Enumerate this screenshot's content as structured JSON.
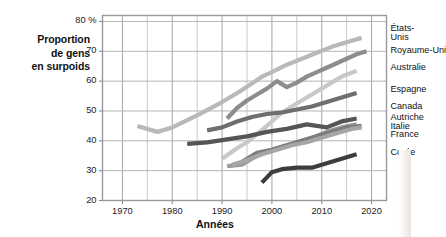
{
  "figure": {
    "background": "#ffffff",
    "plot_background": "#ffffff",
    "grid_color": "#bfbfbf",
    "frame_color": "#9a9a9a"
  },
  "axis_titles": {
    "y_line1": "Proportion",
    "y_line2": "de gens",
    "y_line3": "en surpoids",
    "x": "Années"
  },
  "ticks": {
    "y": [
      "80 %",
      "70",
      "60",
      "50",
      "40",
      "30",
      "20"
    ],
    "x": [
      "1970",
      "1980",
      "1990",
      "2000",
      "2010",
      "2020"
    ]
  },
  "chart_data": {
    "type": "line",
    "title": "",
    "subtitle": "",
    "xlabel": "Années",
    "ylabel": "Proportion de gens en surpoids",
    "xlim": [
      1966,
      2023
    ],
    "ylim": [
      20,
      82
    ],
    "yticks": [
      20,
      30,
      40,
      50,
      60,
      70,
      80
    ],
    "xticks": [
      1970,
      1980,
      1990,
      2000,
      2010,
      2020
    ],
    "grid": true,
    "grid_minor_x_step": 5,
    "legend_position": "right-inline",
    "y_unit": "%",
    "series": [
      {
        "name": "États-Unis",
        "color": "#b9b9b9",
        "label_lines": [
          "États-",
          "Unis"
        ],
        "x": [
          1973,
          1977,
          1980,
          1985,
          1990,
          1994,
          1998,
          2000,
          2003,
          2006,
          2009,
          2012,
          2015,
          2018
        ],
        "values": [
          45.0,
          43.0,
          44.5,
          48.5,
          53.0,
          57.0,
          61.5,
          63.0,
          65.5,
          67.5,
          69.5,
          71.5,
          73.0,
          74.5
        ]
      },
      {
        "name": "Royaume-Uni",
        "color": "#8d8d8d",
        "label_lines": [
          "Royaume-Uni"
        ],
        "x": [
          1991,
          1993,
          1995,
          1997,
          1999,
          2001,
          2003,
          2005,
          2007,
          2009,
          2011,
          2013,
          2015,
          2017,
          2019
        ],
        "values": [
          47.5,
          51.0,
          53.5,
          55.5,
          57.5,
          60.0,
          58.0,
          59.5,
          61.5,
          63.0,
          64.5,
          66.0,
          67.5,
          69.0,
          70.0
        ]
      },
      {
        "name": "Australie",
        "color": "#c8c8c8",
        "label_lines": [
          "Australie"
        ],
        "x": [
          1990,
          1993,
          1995,
          1999,
          2002,
          2005,
          2008,
          2011,
          2014,
          2017
        ],
        "values": [
          34.0,
          37.5,
          39.5,
          45.0,
          49.5,
          52.5,
          55.5,
          58.5,
          61.5,
          63.5
        ]
      },
      {
        "name": "Espagne",
        "color": "#6e6e6e",
        "label_lines": [
          "Espagne"
        ],
        "x": [
          1987,
          1990,
          1993,
          1996,
          1999,
          2002,
          2005,
          2008,
          2011,
          2014,
          2017
        ],
        "values": [
          43.5,
          44.5,
          46.5,
          48.0,
          49.0,
          49.5,
          50.5,
          51.5,
          53.0,
          54.5,
          56.0
        ]
      },
      {
        "name": "Canada",
        "color": "#9c9c9c",
        "label_lines": [
          "Canada"
        ],
        "x": [
          1991,
          1994,
          1996,
          1998,
          2000,
          2003,
          2005,
          2008,
          2011,
          2014,
          2017
        ],
        "values": [
          31.5,
          32.0,
          34.0,
          36.0,
          37.0,
          38.5,
          39.5,
          41.0,
          43.0,
          44.5,
          45.5
        ]
      },
      {
        "name": "Autriche",
        "color": "#555555",
        "label_lines": [
          "Autriche"
        ],
        "x": [
          1983,
          1987,
          1991,
          1995,
          1999,
          2003,
          2007,
          2011,
          2014,
          2017
        ],
        "values": [
          39.0,
          39.5,
          40.5,
          41.5,
          43.0,
          44.0,
          45.5,
          44.5,
          46.5,
          47.5
        ]
      },
      {
        "name": "Italie",
        "color": "#7d7d7d",
        "label_lines": [
          "Italie"
        ],
        "x": [
          1994,
          1997,
          2000,
          2003,
          2006,
          2009,
          2012,
          2015,
          2018
        ],
        "values": [
          33.0,
          36.0,
          37.0,
          38.5,
          40.0,
          41.5,
          43.0,
          44.5,
          45.0
        ]
      },
      {
        "name": "France",
        "color": "#a6a6a6",
        "label_lines": [
          "France"
        ],
        "x": [
          1992,
          1995,
          1998,
          2001,
          2004,
          2007,
          2010,
          2013,
          2016,
          2018
        ],
        "values": [
          32.0,
          33.5,
          35.5,
          37.0,
          38.5,
          39.5,
          41.0,
          42.5,
          44.0,
          44.5
        ]
      },
      {
        "name": "Corée",
        "color": "#3d3d3d",
        "label_lines": [
          "Corée"
        ],
        "x": [
          1998,
          2000,
          2002,
          2005,
          2008,
          2011,
          2014,
          2017
        ],
        "values": [
          26.0,
          29.5,
          30.5,
          31.0,
          31.0,
          32.5,
          34.0,
          35.5
        ]
      }
    ],
    "series_labels": [
      {
        "text": "États-",
        "y_pct": 77.5
      },
      {
        "text": "Unis",
        "y_pct": 74.5
      },
      {
        "text": "Royaume-Uni",
        "y_pct": 70.0
      },
      {
        "text": "Australie",
        "y_pct": 64.5
      },
      {
        "text": "Espagne",
        "y_pct": 57.0
      },
      {
        "text": "Canada",
        "y_pct": 51.5
      },
      {
        "text": "Autriche",
        "y_pct": 47.5
      },
      {
        "text": "Italie",
        "y_pct": 44.7
      },
      {
        "text": "France",
        "y_pct": 42.0
      },
      {
        "text": "Corée",
        "y_pct": 36.0
      }
    ]
  }
}
